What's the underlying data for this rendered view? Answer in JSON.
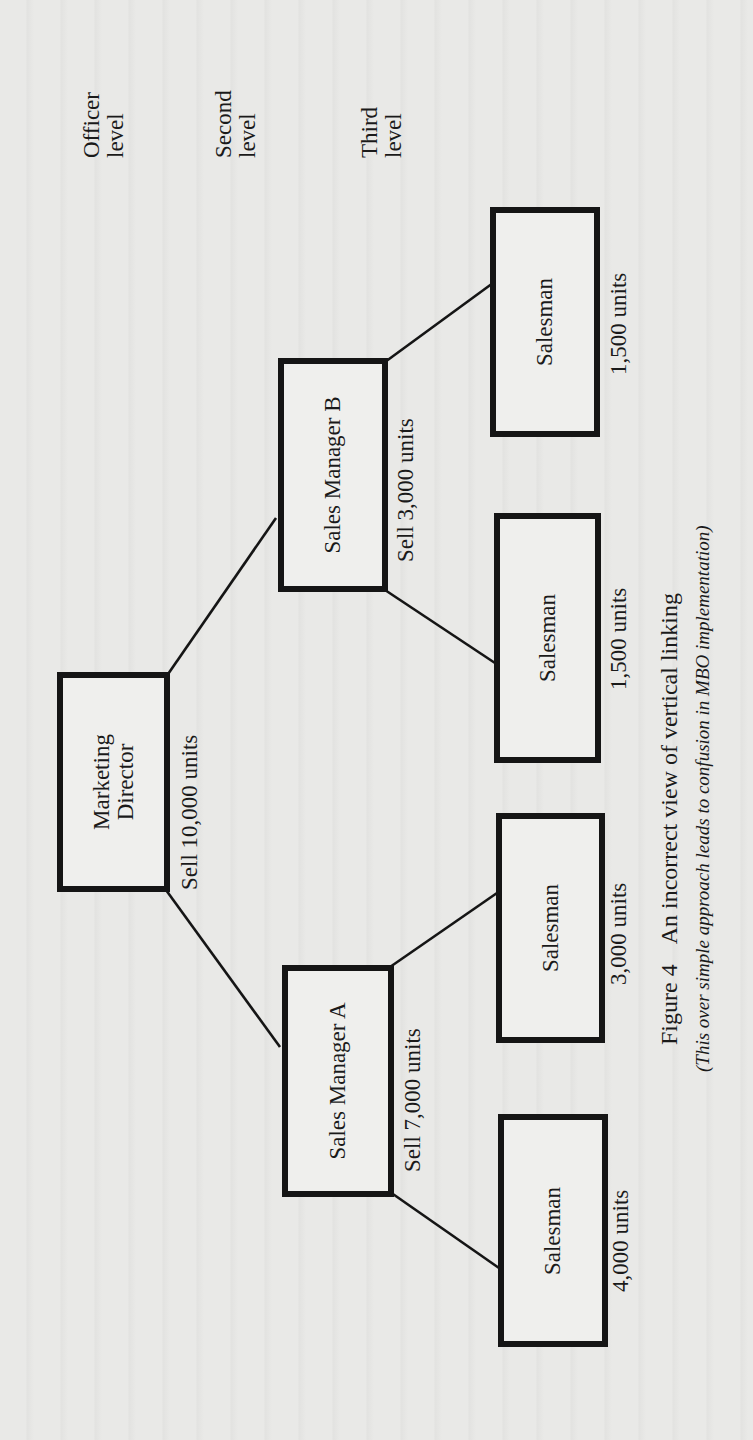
{
  "levels": {
    "officer": "Officer\nlevel",
    "officer_l1": "Officer",
    "officer_l2": "level",
    "second_l1": "Second",
    "second_l2": "level",
    "third_l1": "Third",
    "third_l2": "level"
  },
  "nodes": {
    "marketing_director": {
      "l1": "Marketing",
      "l2": "Director",
      "target": "Sell 10,000 units"
    },
    "sales_manager_a": {
      "label": "Sales Manager A",
      "target": "Sell 7,000 units"
    },
    "sales_manager_b": {
      "label": "Sales Manager B",
      "target": "Sell 3,000 units"
    },
    "salesman_a1": {
      "label": "Salesman",
      "target": "4,000 units"
    },
    "salesman_a2": {
      "label": "Salesman",
      "target": "3,000 units"
    },
    "salesman_b1": {
      "label": "Salesman",
      "target": "1,500 units"
    },
    "salesman_b2": {
      "label": "Salesman",
      "target": "1,500 units"
    }
  },
  "caption": {
    "figure": "Figure 4",
    "title": "An incorrect view of vertical linking",
    "note": "(This over simple approach leads to confusion in MBO implementation)"
  },
  "colors": {
    "page": "#e9e9e7",
    "ink": "#151515"
  }
}
